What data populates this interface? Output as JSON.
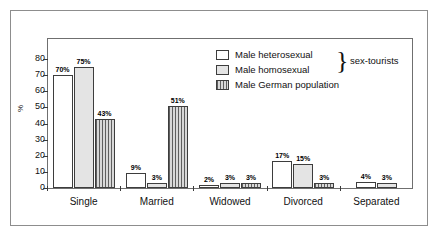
{
  "chart_data": {
    "type": "bar",
    "title": "",
    "xlabel": "",
    "ylabel": "%",
    "ylim": [
      0,
      85
    ],
    "grid": false,
    "legend_position": "top-right",
    "categories": [
      "Single",
      "Married",
      "Widowed",
      "Divorced",
      "Separated"
    ],
    "yticks": [
      0,
      10,
      20,
      30,
      40,
      50,
      60,
      70,
      80
    ],
    "series": [
      {
        "name": "Male heterosexual",
        "values": [
          70,
          9,
          2,
          17,
          4
        ],
        "labels": [
          "70%",
          "9%",
          "2%",
          "17%",
          "4%"
        ],
        "swatch": "white"
      },
      {
        "name": "Male homosexual",
        "values": [
          75,
          3,
          3,
          15,
          3
        ],
        "labels": [
          "75%",
          "3%",
          "3%",
          "15%",
          "3%"
        ],
        "swatch": "light-gray"
      },
      {
        "name": "Male German population",
        "values": [
          43,
          51,
          3,
          3,
          null
        ],
        "labels": [
          "43%",
          "51%",
          "3%",
          "3%",
          ""
        ],
        "swatch": "vertical-hatch"
      }
    ],
    "annotations": [
      {
        "text": "sex-tourists",
        "target": [
          "Male heterosexual",
          "Male homosexual"
        ],
        "style": "brace"
      }
    ]
  },
  "legend": {
    "items": [
      {
        "label": "Male heterosexual"
      },
      {
        "label": "Male homosexual"
      },
      {
        "label": "Male German population"
      }
    ],
    "brace_glyph": "}",
    "brace_label": "sex-tourists"
  },
  "axis": {
    "y_label": "%",
    "y_ticks": [
      "0",
      "10",
      "20",
      "30",
      "40",
      "50",
      "60",
      "70",
      "80"
    ],
    "x_labels": [
      "Single",
      "Married",
      "Widowed",
      "Divorced",
      "Separated"
    ]
  },
  "colors": {
    "frame": "#8d8d8d",
    "plot_border": "#6f6f6f",
    "bar_outline": "#3d3d3d",
    "series_hetero": "#ffffff",
    "series_homo": "#e4e4e4",
    "series_german": "#cfcfcf",
    "text": "#111111"
  }
}
